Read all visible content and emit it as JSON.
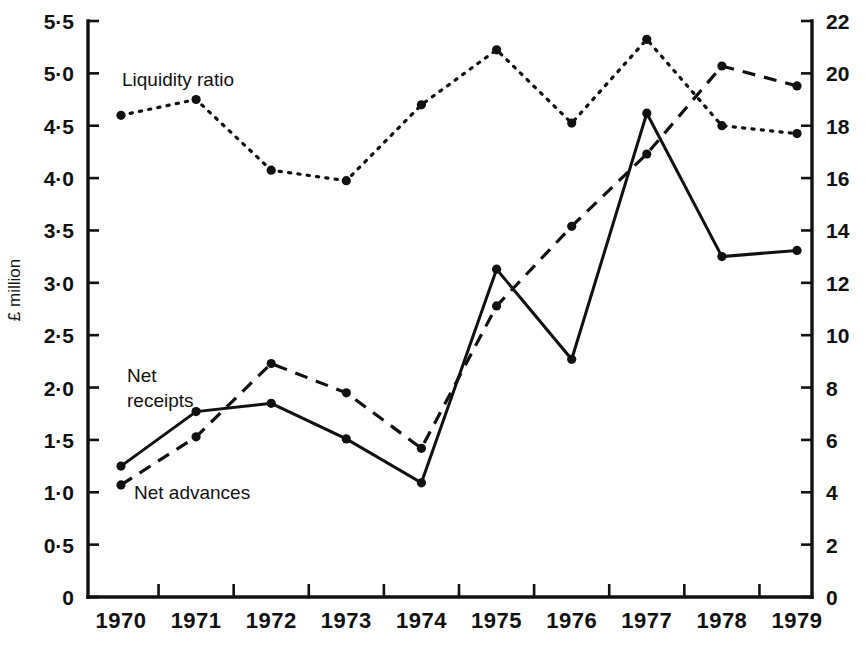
{
  "chart_data": {
    "type": "line",
    "title": "",
    "xlabel": "",
    "ylabel": "£ million",
    "y2label": "",
    "x": [
      "1970",
      "1971",
      "1972",
      "1973",
      "1974",
      "1975",
      "1976",
      "1977",
      "1978",
      "1979"
    ],
    "categories": [
      "1970",
      "1971",
      "1972",
      "1973",
      "1974",
      "1975",
      "1976",
      "1977",
      "1978",
      "1979"
    ],
    "ylim": [
      0,
      5.5
    ],
    "y2lim": [
      0,
      22
    ],
    "yticks": [
      "0",
      "0·5",
      "1·0",
      "1·5",
      "2·0",
      "2·5",
      "3·0",
      "3·5",
      "4·0",
      "4·5",
      "5·0",
      "5·5"
    ],
    "ytick_values": [
      0,
      0.5,
      1.0,
      1.5,
      2.0,
      2.5,
      3.0,
      3.5,
      4.0,
      4.5,
      5.0,
      5.5
    ],
    "y2ticks": [
      "0",
      "2",
      "4",
      "6",
      "8",
      "10",
      "12",
      "14",
      "16",
      "18",
      "20",
      "22"
    ],
    "y2tick_values": [
      0,
      2,
      4,
      6,
      8,
      10,
      12,
      14,
      16,
      18,
      20,
      22
    ],
    "grid": false,
    "legend_position": "inline-annotations",
    "series": [
      {
        "name": "Net receipts",
        "style": "solid",
        "axis": "left",
        "values": [
          1.25,
          1.77,
          1.85,
          1.51,
          1.09,
          3.13,
          2.27,
          4.62,
          3.25,
          3.31
        ]
      },
      {
        "name": "Net advances",
        "style": "dashed",
        "axis": "left",
        "values": [
          1.07,
          1.53,
          2.23,
          1.95,
          1.42,
          2.78,
          3.54,
          4.23,
          5.07,
          4.88
        ]
      },
      {
        "name": "Liquidity ratio",
        "style": "dotted",
        "axis": "right",
        "values": [
          18.4,
          19.0,
          16.3,
          15.9,
          18.8,
          20.9,
          18.1,
          21.3,
          18.0,
          17.7
        ]
      }
    ],
    "annotations": [
      {
        "text": "Liquidity ratio",
        "series": "Liquidity ratio"
      },
      {
        "text": "Net",
        "series": "Net receipts"
      },
      {
        "text": "receipts",
        "series": "Net receipts"
      },
      {
        "text": "Net advances",
        "series": "Net advances"
      }
    ]
  }
}
